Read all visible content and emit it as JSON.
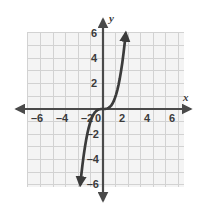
{
  "figure": {
    "name": "cubic-function-graph",
    "background_color": "#ffffff",
    "width": 205,
    "height": 217
  },
  "chart_data": {
    "type": "line",
    "title": "",
    "subtitle": "",
    "xlabel": "x",
    "ylabel": "y",
    "function": "y = x^3",
    "xlim": [
      -6.6,
      6.6
    ],
    "ylim": [
      -6.6,
      6.6
    ],
    "grid": true,
    "grid_step": 1,
    "legend": "none",
    "x_ticks": [
      -6,
      -4,
      -2,
      0,
      2,
      4,
      6
    ],
    "x_tick_labels": [
      "–6",
      "–4",
      "–2",
      "0",
      "2",
      "4",
      "6"
    ],
    "y_ticks": [
      -6,
      -4,
      -2,
      2,
      4,
      6
    ],
    "y_tick_labels": [
      "–6",
      "–4",
      "–2",
      "2",
      "4",
      "6"
    ],
    "series": [
      {
        "name": "y = x^3",
        "color": "#3b3b3b",
        "line_width": 2.6,
        "arrow_start": true,
        "arrow_end": true,
        "x": [
          -1.82,
          -1.75,
          -1.65,
          -1.55,
          -1.45,
          -1.35,
          -1.25,
          -1.15,
          -1.05,
          -0.95,
          -0.85,
          -0.75,
          -0.65,
          -0.55,
          -0.45,
          -0.35,
          -0.25,
          -0.15,
          0,
          0.15,
          0.25,
          0.35,
          0.45,
          0.55,
          0.65,
          0.75,
          0.85,
          0.95,
          1.05,
          1.15,
          1.25,
          1.35,
          1.45,
          1.55,
          1.65,
          1.75,
          1.82
        ],
        "y": [
          -6.03,
          -5.36,
          -4.49,
          -3.72,
          -3.05,
          -2.46,
          -1.95,
          -1.52,
          -1.16,
          -0.86,
          -0.61,
          -0.42,
          -0.27,
          -0.17,
          -0.09,
          -0.04,
          -0.02,
          0.0,
          0.0,
          0.0,
          0.02,
          0.04,
          0.09,
          0.17,
          0.27,
          0.42,
          0.61,
          0.86,
          1.16,
          1.52,
          1.95,
          2.46,
          3.05,
          3.72,
          4.49,
          5.36,
          6.03
        ]
      }
    ]
  },
  "axes": {
    "x_axis_name": "x",
    "y_axis_name": "y",
    "axis_color": "#4a4a4a",
    "grid_color": "#d2d2d2",
    "grid_fill": "#f4f4f4",
    "arrows": [
      "left",
      "right",
      "up",
      "down"
    ]
  },
  "labels": {
    "x_neg6": "–6",
    "x_neg4": "–4",
    "x_neg2": "–2",
    "origin": "0",
    "x_pos2": "2",
    "x_pos4": "4",
    "x_pos6": "6",
    "y_pos6": "6",
    "y_pos4": "4",
    "y_pos2": "2",
    "y_neg2": "–2",
    "y_neg4": "–4",
    "y_neg6": "–6"
  }
}
